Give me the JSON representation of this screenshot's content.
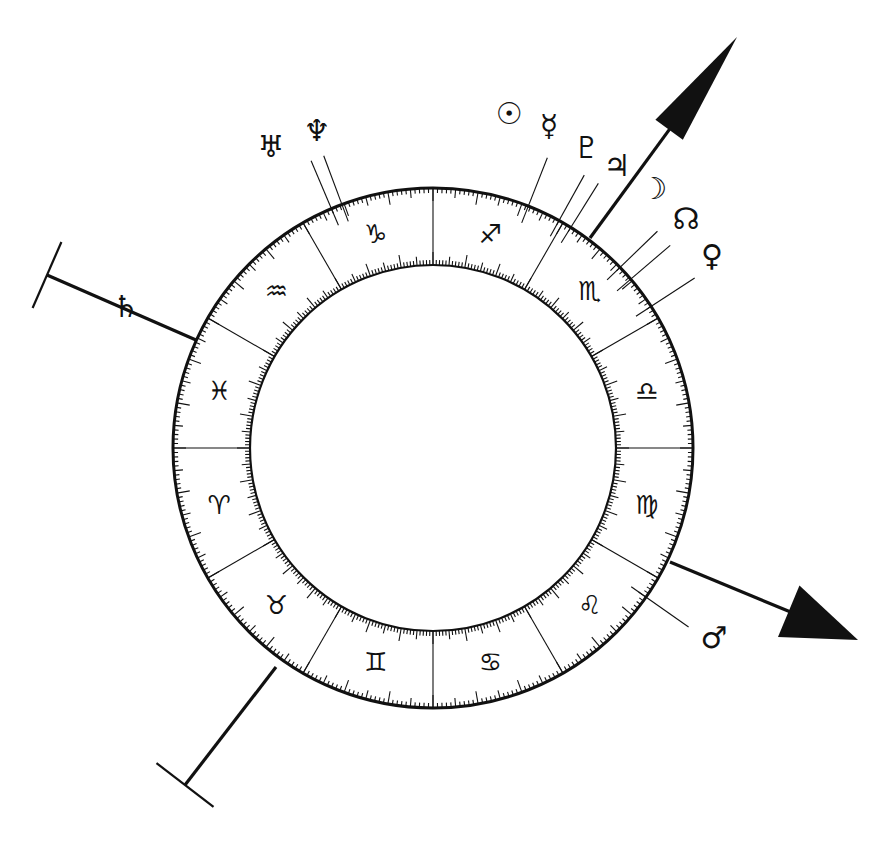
{
  "chart_data": {
    "type": "diagram",
    "center": [
      433,
      448
    ],
    "outer_radius": 260,
    "inner_radius": 183,
    "zodiac_start_screen_angle_deg": 180,
    "signs": [
      {
        "name": "Aries",
        "glyph": "♈",
        "start": 0
      },
      {
        "name": "Taurus",
        "glyph": "♉",
        "start": 30
      },
      {
        "name": "Gemini",
        "glyph": "♊",
        "start": 60
      },
      {
        "name": "Cancer",
        "glyph": "♋",
        "start": 90
      },
      {
        "name": "Leo",
        "glyph": "♌",
        "start": 120
      },
      {
        "name": "Virgo",
        "glyph": "♍",
        "start": 150
      },
      {
        "name": "Libra",
        "glyph": "♎",
        "start": 180
      },
      {
        "name": "Scorpio",
        "glyph": "♏",
        "start": 210
      },
      {
        "name": "Sagittarius",
        "glyph": "♐",
        "start": 240
      },
      {
        "name": "Capricorn",
        "glyph": "♑",
        "start": 270
      },
      {
        "name": "Aquarius",
        "glyph": "♒",
        "start": 300
      },
      {
        "name": "Pisces",
        "glyph": "♓",
        "start": 330
      }
    ],
    "planets": [
      {
        "name": "Uranus",
        "glyph": "♅",
        "line_angle_deg": 113,
        "label_pos": [
          271,
          146
        ]
      },
      {
        "name": "Neptune",
        "glyph": "♆",
        "line_angle_deg": 110.5,
        "label_pos": [
          317,
          130
        ]
      },
      {
        "name": "Sun",
        "glyph": "☉",
        "line_angle_deg": 0,
        "label_pos": [
          509,
          113
        ],
        "no_line": true
      },
      {
        "name": "Mercury",
        "glyph": "☿",
        "line_angle_deg": 68.5,
        "label_pos": [
          549,
          125
        ]
      },
      {
        "name": "Pluto",
        "glyph": "♇",
        "line_angle_deg": 61,
        "label_pos": [
          587,
          147
        ]
      },
      {
        "name": "Jupiter",
        "glyph": "♃",
        "line_angle_deg": 58,
        "label_pos": [
          617,
          165
        ]
      },
      {
        "name": "Moon",
        "glyph": "☽",
        "line_angle_deg": 44,
        "label_pos": [
          654,
          188
        ]
      },
      {
        "name": "North Node",
        "glyph": "☊",
        "line_angle_deg": 40.5,
        "label_pos": [
          686,
          218
        ]
      },
      {
        "name": "Venus",
        "glyph": "♀",
        "line_angle_deg": 33,
        "label_pos": [
          712,
          255
        ]
      },
      {
        "name": "Mars",
        "glyph": "♂",
        "line_angle_deg": -35,
        "label_pos": [
          714,
          637
        ]
      },
      {
        "name": "Saturn",
        "glyph": "♄",
        "line_angle_deg": 155,
        "label_pos": [
          126,
          306
        ],
        "on_axis": true
      }
    ],
    "axes": [
      {
        "name": "ascendant-arrow",
        "from": [
          590,
          238
        ],
        "to": [
          737,
          37
        ],
        "head": "filled-arrow"
      },
      {
        "name": "mc-arrow",
        "from": [
          670,
          562
        ],
        "to": [
          858,
          640
        ],
        "head": "filled-arrow"
      },
      {
        "name": "descendant-bar",
        "from": [
          196,
          340
        ],
        "to": [
          47,
          275
        ],
        "head": "t-bar"
      },
      {
        "name": "ic-bar",
        "from": [
          276,
          667
        ],
        "to": [
          185,
          785
        ],
        "head": "t-bar"
      }
    ]
  },
  "labels": {
    "signs": [
      "♈",
      "♉",
      "♊",
      "♋",
      "♌",
      "♍",
      "♎",
      "♏",
      "♐",
      "♑",
      "♒",
      "♓"
    ],
    "planets": {
      "uranus": "♅",
      "neptune": "♆",
      "sun": "☉",
      "mercury": "☿",
      "pluto": "♇",
      "jupiter": "♃",
      "moon": "☽",
      "node": "☊",
      "venus": "♀",
      "mars": "♂",
      "saturn": "♄"
    }
  },
  "colors": {
    "ink": "#111111",
    "background": "#ffffff"
  }
}
